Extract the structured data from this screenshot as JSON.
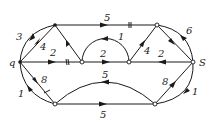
{
  "diagram": {
    "type": "flow-network",
    "nodes": [
      {
        "id": "q",
        "label": "q",
        "x": 20,
        "y": 62,
        "role": "source"
      },
      {
        "id": "A",
        "label": "",
        "x": 55,
        "y": 25
      },
      {
        "id": "B",
        "label": "",
        "x": 157,
        "y": 25
      },
      {
        "id": "C",
        "label": "",
        "x": 82,
        "y": 62
      },
      {
        "id": "D",
        "label": "",
        "x": 129,
        "y": 62
      },
      {
        "id": "S",
        "label": "S",
        "x": 193,
        "y": 62,
        "role": "sink"
      },
      {
        "id": "E",
        "label": "",
        "x": 55,
        "y": 104
      },
      {
        "id": "F",
        "label": "",
        "x": 155,
        "y": 104
      }
    ],
    "edges": [
      {
        "from": "q",
        "to": "A",
        "capacity": "3",
        "shape": "arc"
      },
      {
        "from": "A",
        "to": "q",
        "capacity": "4",
        "shape": "straight"
      },
      {
        "from": "A",
        "to": "B",
        "capacity": "5",
        "shape": "straight",
        "marked": true
      },
      {
        "from": "C",
        "to": "A",
        "capacity": "",
        "shape": "straight"
      },
      {
        "from": "q",
        "to": "C",
        "capacity": "2",
        "shape": "straight",
        "marked": true
      },
      {
        "from": "D",
        "to": "C",
        "capacity": "1",
        "shape": "arc"
      },
      {
        "from": "C",
        "to": "D",
        "capacity": "2",
        "shape": "straight"
      },
      {
        "from": "D",
        "to": "B",
        "capacity": "4",
        "shape": "straight"
      },
      {
        "from": "B",
        "to": "S",
        "capacity": "",
        "shape": "straight"
      },
      {
        "from": "S",
        "to": "B",
        "capacity": "6",
        "shape": "arc"
      },
      {
        "from": "S",
        "to": "D",
        "capacity": "2",
        "shape": "straight"
      },
      {
        "from": "q",
        "to": "E",
        "capacity": "8",
        "shape": "straight",
        "marked": true
      },
      {
        "from": "E",
        "to": "q",
        "capacity": "1",
        "shape": "arc"
      },
      {
        "from": "F",
        "to": "E",
        "capacity": "5",
        "shape": "arc"
      },
      {
        "from": "E",
        "to": "F",
        "capacity": "5",
        "shape": "straight"
      },
      {
        "from": "F",
        "to": "S",
        "capacity": "8",
        "shape": "straight"
      },
      {
        "from": "S",
        "to": "F",
        "capacity": "1",
        "shape": "arc"
      }
    ],
    "labels": {
      "source": "q",
      "sink": "S",
      "qA_arc": "3",
      "Aq_line": "4",
      "AB": "5",
      "qC": "2",
      "DC_arc": "1",
      "CD": "2",
      "DB": "4",
      "SB_arc": "6",
      "SD": "2",
      "qE": "8",
      "Eq_arc": "1",
      "FE_arc": "5",
      "EF": "5",
      "FS": "8",
      "SF_arc": "1"
    }
  }
}
